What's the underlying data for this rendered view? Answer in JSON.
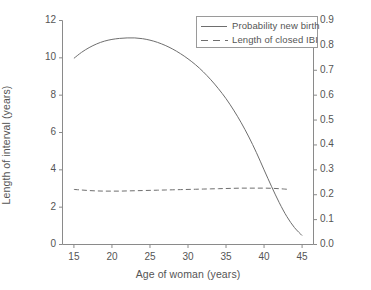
{
  "chart_data": {
    "type": "line",
    "title": "",
    "xlabel": "Age of woman (years)",
    "ylabel": "Length of interval (years)",
    "ylabel_right": "Probability of a new birth",
    "xlim": [
      13.5,
      46.5
    ],
    "ylim": [
      0,
      12
    ],
    "ylim_right": [
      0.0,
      0.9
    ],
    "xticks": [
      15,
      20,
      25,
      30,
      35,
      40,
      45
    ],
    "xtick_labels": [
      "15",
      "20",
      "25",
      "30",
      "35",
      "40",
      "45"
    ],
    "yticks": [
      0,
      2,
      4,
      6,
      8,
      10,
      12
    ],
    "ytick_labels": [
      "0",
      "2",
      "4",
      "6",
      "8",
      "10",
      "12"
    ],
    "yticks_right": [
      0.0,
      0.1,
      0.2,
      0.3,
      0.4,
      0.5,
      0.6,
      0.7,
      0.8,
      0.9
    ],
    "ytick_labels_right": [
      "0.0",
      "0.1",
      "0.2",
      "0.3",
      "0.4",
      "0.5",
      "0.6",
      "0.7",
      "0.8",
      "0.9"
    ],
    "grid": false,
    "legend_position": "top-right",
    "line_color": "#6e6e6e",
    "axis_color": "#8a8a8a",
    "series": [
      {
        "name": "Probability new birth",
        "style": "solid",
        "axis": "right",
        "x": [
          15,
          16,
          17,
          18,
          19,
          20,
          21,
          22,
          23,
          24,
          25,
          26,
          27,
          28,
          29,
          30,
          31,
          32,
          33,
          34,
          35,
          36,
          37,
          38,
          39,
          40,
          41,
          42,
          43,
          44,
          45
        ],
        "values": [
          0.748,
          0.772,
          0.791,
          0.806,
          0.817,
          0.824,
          0.828,
          0.83,
          0.83,
          0.827,
          0.821,
          0.812,
          0.8,
          0.785,
          0.767,
          0.746,
          0.722,
          0.694,
          0.662,
          0.626,
          0.586,
          0.54,
          0.489,
          0.432,
          0.369,
          0.3,
          0.232,
          0.168,
          0.112,
          0.068,
          0.036
        ]
      },
      {
        "name": "Length of closed IBI",
        "style": "dashed",
        "axis": "left",
        "x": [
          15,
          16,
          17,
          18,
          19,
          20,
          21,
          22,
          23,
          24,
          25,
          26,
          27,
          28,
          29,
          30,
          31,
          32,
          33,
          34,
          35,
          36,
          37,
          38,
          39,
          40,
          41,
          42,
          43
        ],
        "values": [
          2.95,
          2.92,
          2.89,
          2.87,
          2.86,
          2.86,
          2.86,
          2.87,
          2.88,
          2.89,
          2.9,
          2.91,
          2.92,
          2.93,
          2.94,
          2.95,
          2.96,
          2.97,
          2.98,
          2.99,
          3.0,
          3.01,
          3.02,
          3.02,
          3.02,
          3.02,
          3.01,
          2.99,
          2.96
        ]
      }
    ]
  },
  "legend": {
    "items": [
      {
        "label": "Probability new birth",
        "style": "solid"
      },
      {
        "label": "Length of closed IBI",
        "style": "dashed"
      }
    ]
  }
}
